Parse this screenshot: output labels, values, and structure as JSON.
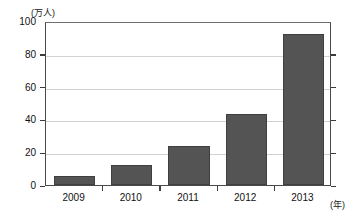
{
  "chart_data": {
    "type": "bar",
    "title": "",
    "subtitle": "",
    "xlabel": "(年)",
    "ylabel": "(万人)",
    "categories": [
      "2009",
      "2010",
      "2011",
      "2012",
      "2013"
    ],
    "values": [
      5.5,
      12.5,
      24,
      43,
      92
    ],
    "series": [
      {
        "name": "",
        "values": [
          5.5,
          12.5,
          24,
          43,
          92
        ]
      }
    ],
    "ylim": [
      0,
      100
    ],
    "ytick_labels": [
      "0",
      "20",
      "40",
      "60",
      "80",
      "100"
    ],
    "ytick_values": [
      0,
      20,
      40,
      60,
      80,
      100
    ],
    "grid": true,
    "grid_axis": "y",
    "legend": false,
    "legend_position": "none",
    "bar_color": "#545454",
    "axis_color": "#3c3c3c",
    "grid_color": "#d2d2d2",
    "background": "#ffffff"
  },
  "axis": {
    "y_unit": "(万人)",
    "x_unit": "(年)"
  }
}
